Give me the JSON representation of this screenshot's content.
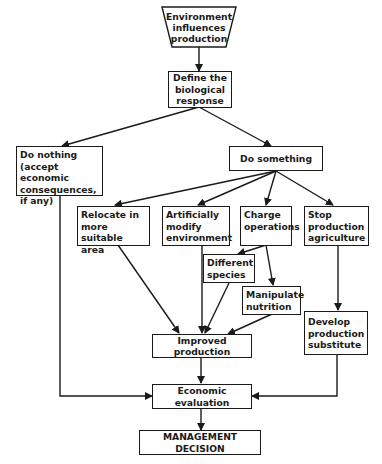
{
  "diagram": {
    "nodes": {
      "environment": "Environment\ninfluences\nproduction",
      "define": "Define the\nbiological\nresponse",
      "do_nothing": "Do nothing\n(accept economic\nconsequences,\nif any)",
      "do_something": "Do something",
      "relocate": "Relocate in\nmore suitable\narea",
      "artificially": "Artificially\nmodify\nenvironment",
      "charge": "Charge\noperations",
      "stop": "Stop\nproduction\nagriculture",
      "different": "Different\nspecies",
      "manipulate": "Manipulate\nnutrition",
      "develop": "Develop\nproduction\nsubstitute",
      "improved": "Improved production",
      "economic": "Economic evaluation",
      "management": "MANAGEMENT DECISION"
    },
    "edges": [
      [
        "environment",
        "define"
      ],
      [
        "define",
        "do_nothing"
      ],
      [
        "define",
        "do_something"
      ],
      [
        "do_something",
        "relocate"
      ],
      [
        "do_something",
        "artificially"
      ],
      [
        "do_something",
        "charge"
      ],
      [
        "do_something",
        "stop"
      ],
      [
        "charge",
        "different"
      ],
      [
        "charge",
        "manipulate"
      ],
      [
        "relocate",
        "improved"
      ],
      [
        "artificially",
        "improved"
      ],
      [
        "different",
        "improved"
      ],
      [
        "manipulate",
        "improved"
      ],
      [
        "stop",
        "develop"
      ],
      [
        "improved",
        "economic"
      ],
      [
        "do_nothing",
        "economic"
      ],
      [
        "develop",
        "economic"
      ],
      [
        "economic",
        "management"
      ]
    ]
  }
}
